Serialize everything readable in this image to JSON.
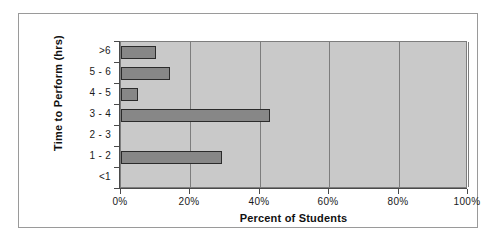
{
  "chart_data": {
    "type": "bar",
    "orientation": "horizontal",
    "title": "",
    "xlabel": "Percent of Students",
    "ylabel": "Time to Perform (hrs)",
    "categories": [
      "<1",
      "1 - 2",
      "2 - 3",
      "3 - 4",
      "4 - 5",
      "5 - 6",
      ">6"
    ],
    "values": [
      0,
      29,
      0,
      43,
      5,
      14,
      10
    ],
    "xlim": [
      0,
      100
    ],
    "xticks": [
      0,
      20,
      40,
      60,
      80,
      100
    ],
    "xtick_labels": [
      "0%",
      "20%",
      "40%",
      "60%",
      "80%",
      "100%"
    ],
    "grid": "vertical",
    "legend": "none",
    "bar_color": "#878787",
    "bar_border_color": "#2b2b2b",
    "plot_background": "#c9c9c9",
    "axis_color": "#4a4a4a",
    "frame_color": "#9a9a9a"
  }
}
